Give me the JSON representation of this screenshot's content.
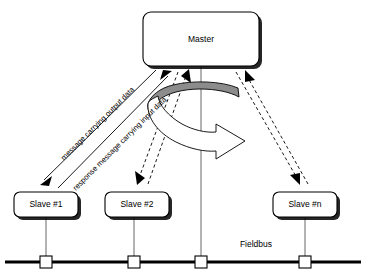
{
  "diagram": {
    "nodes": {
      "master": {
        "label": "Master"
      },
      "slave1": {
        "label": "Slave #1"
      },
      "slave2": {
        "label": "Slave #2"
      },
      "slaven": {
        "label": "Slave #n"
      }
    },
    "bus": {
      "label": "Fieldbus"
    },
    "flows": {
      "output": {
        "label": "message carrying output data"
      },
      "input": {
        "label": "response message carrying input data"
      }
    },
    "colors": {
      "background": "#ffffff",
      "stroke": "#000000",
      "ribbon_fill": "#8c8c8c",
      "arrow_fill": "#ffffff",
      "drop_line": "#555555"
    }
  }
}
